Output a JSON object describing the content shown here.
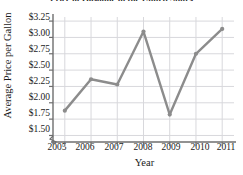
{
  "chart_data": {
    "type": "line",
    "title": "Price of Gasoline in the United States",
    "xlabel": "Year",
    "ylabel": "Average Price per Gallon",
    "categories": [
      "2005",
      "2006",
      "2007",
      "2008",
      "2009",
      "2010",
      "2011"
    ],
    "x": [
      2005,
      2006,
      2007,
      2008,
      2009,
      2010,
      2011
    ],
    "values": [
      1.88,
      2.36,
      2.28,
      3.09,
      1.82,
      2.75,
      3.13
    ],
    "series": [
      {
        "name": "Average Price per Gallon",
        "values": [
          1.88,
          2.36,
          2.28,
          3.09,
          1.82,
          2.75,
          3.13
        ]
      }
    ],
    "ylim": [
      1.4,
      3.3125
    ],
    "xlim": [
      2004.55,
      2011.45
    ],
    "yticks": [
      1.5,
      1.75,
      2.0,
      2.25,
      2.5,
      2.75,
      3.0,
      3.25
    ],
    "ytick_labels": [
      "$1.50",
      "$1.75",
      "$2.00",
      "$2.25",
      "$2.50",
      "$2.75",
      "$3.00",
      "$3.25"
    ],
    "xticks": [
      2005,
      2006,
      2007,
      2008,
      2009,
      2010,
      2011
    ],
    "xtick_labels": [
      "2005",
      "2006",
      "2007",
      "2008",
      "2009",
      "2010",
      "2011"
    ],
    "grid": true,
    "grid_axis": "both",
    "legend": false,
    "legend_position": "none",
    "markers": true,
    "colors": {
      "line": "#8c8c8c",
      "marker": "#8c8c8c",
      "grid": "#d8d8dc",
      "axis": "#6e6e6e",
      "text": "#1a1a1a"
    }
  }
}
